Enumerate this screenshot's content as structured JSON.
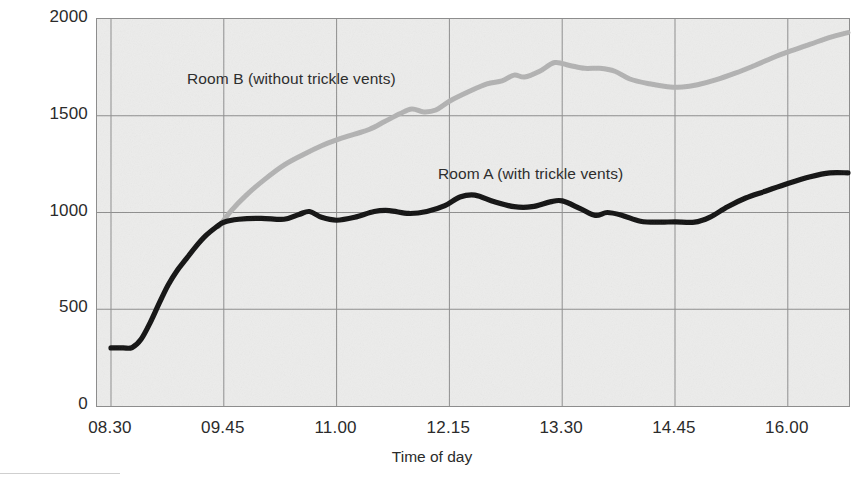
{
  "chart_data": {
    "type": "line",
    "title": "",
    "xlabel": "Time of day",
    "ylabel": "Carbon dioxide (ppm)",
    "ylim": [
      0,
      2000
    ],
    "yticks": [
      0,
      500,
      1000,
      1500,
      2000
    ],
    "ytick_labels": [
      "0",
      "500",
      "1000",
      "1500",
      "2000"
    ],
    "xtick_labels": [
      "08.30",
      "09.45",
      "11.00",
      "12.15",
      "13.30",
      "14.45",
      "16.00"
    ],
    "x_unit": "time of day (hh.mm)",
    "grid": true,
    "legend": "inline-annotations",
    "annotations": [
      {
        "text": "Room B (without trickle vents)",
        "series": "Room B",
        "x": "10.10",
        "y": 1720
      },
      {
        "text": "Room A (with trickle vents)",
        "series": "Room A",
        "x": "12.50",
        "y": 1230
      }
    ],
    "series": [
      {
        "name": "Room A",
        "label": "Room A (with trickle vents)",
        "color": "#111111",
        "points": [
          {
            "x": "08.30",
            "y": 300
          },
          {
            "x": "08.38",
            "y": 300
          },
          {
            "x": "08.44",
            "y": 302
          },
          {
            "x": "08.50",
            "y": 345
          },
          {
            "x": "08.56",
            "y": 430
          },
          {
            "x": "09.02",
            "y": 530
          },
          {
            "x": "09.08",
            "y": 625
          },
          {
            "x": "09.14",
            "y": 700
          },
          {
            "x": "09.20",
            "y": 760
          },
          {
            "x": "09.26",
            "y": 820
          },
          {
            "x": "09.33",
            "y": 880
          },
          {
            "x": "09.40",
            "y": 925
          },
          {
            "x": "09.45",
            "y": 950
          },
          {
            "x": "09.55",
            "y": 965
          },
          {
            "x": "10.10",
            "y": 970
          },
          {
            "x": "10.25",
            "y": 965
          },
          {
            "x": "10.35",
            "y": 990
          },
          {
            "x": "10.42",
            "y": 1005
          },
          {
            "x": "10.50",
            "y": 975
          },
          {
            "x": "11.00",
            "y": 960
          },
          {
            "x": "11.12",
            "y": 975
          },
          {
            "x": "11.25",
            "y": 1005
          },
          {
            "x": "11.35",
            "y": 1010
          },
          {
            "x": "11.48",
            "y": 995
          },
          {
            "x": "12.00",
            "y": 1005
          },
          {
            "x": "12.12",
            "y": 1035
          },
          {
            "x": "12.22",
            "y": 1080
          },
          {
            "x": "12.32",
            "y": 1090
          },
          {
            "x": "12.45",
            "y": 1055
          },
          {
            "x": "12.58",
            "y": 1030
          },
          {
            "x": "13.10",
            "y": 1030
          },
          {
            "x": "13.22",
            "y": 1055
          },
          {
            "x": "13.30",
            "y": 1060
          },
          {
            "x": "13.42",
            "y": 1020
          },
          {
            "x": "13.52",
            "y": 985
          },
          {
            "x": "14.00",
            "y": 1000
          },
          {
            "x": "14.10",
            "y": 985
          },
          {
            "x": "14.22",
            "y": 955
          },
          {
            "x": "14.35",
            "y": 950
          },
          {
            "x": "14.45",
            "y": 952
          },
          {
            "x": "14.58",
            "y": 950
          },
          {
            "x": "15.08",
            "y": 975
          },
          {
            "x": "15.20",
            "y": 1030
          },
          {
            "x": "15.32",
            "y": 1075
          },
          {
            "x": "15.45",
            "y": 1110
          },
          {
            "x": "16.00",
            "y": 1150
          },
          {
            "x": "16.15",
            "y": 1185
          },
          {
            "x": "16.28",
            "y": 1205
          },
          {
            "x": "16.40",
            "y": 1205
          }
        ]
      },
      {
        "name": "Room B",
        "label": "Room B (without trickle vents)",
        "color": "#b2b2b2",
        "points": [
          {
            "x": "09.42",
            "y": 930
          },
          {
            "x": "09.50",
            "y": 1010
          },
          {
            "x": "10.00",
            "y": 1090
          },
          {
            "x": "10.12",
            "y": 1170
          },
          {
            "x": "10.25",
            "y": 1245
          },
          {
            "x": "10.38",
            "y": 1300
          },
          {
            "x": "10.50",
            "y": 1345
          },
          {
            "x": "11.00",
            "y": 1375
          },
          {
            "x": "11.12",
            "y": 1405
          },
          {
            "x": "11.22",
            "y": 1430
          },
          {
            "x": "11.32",
            "y": 1470
          },
          {
            "x": "11.42",
            "y": 1510
          },
          {
            "x": "11.50",
            "y": 1535
          },
          {
            "x": "11.58",
            "y": 1520
          },
          {
            "x": "12.06",
            "y": 1530
          },
          {
            "x": "12.15",
            "y": 1575
          },
          {
            "x": "12.28",
            "y": 1625
          },
          {
            "x": "12.40",
            "y": 1665
          },
          {
            "x": "12.50",
            "y": 1680
          },
          {
            "x": "12.58",
            "y": 1710
          },
          {
            "x": "13.05",
            "y": 1700
          },
          {
            "x": "13.15",
            "y": 1730
          },
          {
            "x": "13.25",
            "y": 1775
          },
          {
            "x": "13.35",
            "y": 1760
          },
          {
            "x": "13.45",
            "y": 1745
          },
          {
            "x": "13.55",
            "y": 1745
          },
          {
            "x": "14.05",
            "y": 1730
          },
          {
            "x": "14.15",
            "y": 1690
          },
          {
            "x": "14.28",
            "y": 1665
          },
          {
            "x": "14.40",
            "y": 1650
          },
          {
            "x": "14.50",
            "y": 1648
          },
          {
            "x": "15.00",
            "y": 1660
          },
          {
            "x": "15.12",
            "y": 1685
          },
          {
            "x": "15.25",
            "y": 1720
          },
          {
            "x": "15.38",
            "y": 1760
          },
          {
            "x": "15.50",
            "y": 1800
          },
          {
            "x": "16.02",
            "y": 1835
          },
          {
            "x": "16.15",
            "y": 1870
          },
          {
            "x": "16.28",
            "y": 1905
          },
          {
            "x": "16.40",
            "y": 1930
          }
        ]
      }
    ]
  },
  "axes": {
    "y_title": "Carbon dioxide (ppm)",
    "x_title": "Time of day"
  },
  "colors": {
    "room_a": "#111111",
    "room_b": "#b2b2b2",
    "grid": "#8d8d8d",
    "plot_background": "#ececeb",
    "text": "#2b2b2b"
  }
}
